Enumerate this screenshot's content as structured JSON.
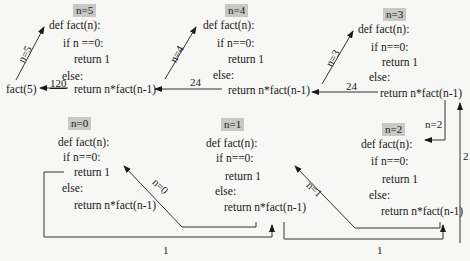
{
  "diagram": {
    "call_expr": "fact(5)",
    "frames": [
      {
        "label": "n=5",
        "lines": [
          "def fact(n):",
          "if n ==0:",
          "return 1",
          "else:",
          "return n*fact(n-1)"
        ]
      },
      {
        "label": "n=4",
        "lines": [
          "def fact(n):",
          "if n==0:",
          "return 1",
          "else:",
          "return n*fact(n-1)"
        ]
      },
      {
        "label": "n=3",
        "lines": [
          "def fact(n):",
          "if n==0:",
          "return 1",
          "else:",
          "return n*fact(n-1)"
        ]
      },
      {
        "label": "n=2",
        "lines": [
          "def fact(n):",
          "if n==0:",
          "return 1",
          "else:",
          "return n*fact(n-1)"
        ]
      },
      {
        "label": "n=1",
        "lines": [
          "def fact(n):",
          "if n==0:",
          "return 1",
          "else:",
          "return n*fact(n-1)"
        ]
      },
      {
        "label": "n=0",
        "lines": [
          "def fact(n):",
          "if n==0:",
          "return 1",
          "else:",
          "return n*fact(n-1)"
        ]
      }
    ],
    "call_edges": [
      "n=5",
      "n=4",
      "n=3",
      "n=2",
      "n=1",
      "n=0"
    ],
    "return_edges": [
      "120",
      "24",
      "24",
      "2",
      "1",
      "1"
    ]
  }
}
